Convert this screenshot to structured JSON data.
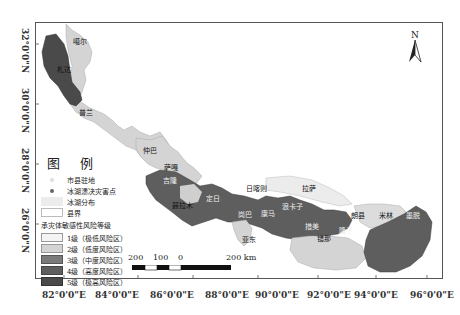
{
  "map": {
    "legend": {
      "title": "图 例",
      "items": [
        {
          "symbol": "city-dot",
          "label": "市县驻地"
        },
        {
          "symbol": "disaster-point",
          "label": "冰湖溃决灾害点"
        },
        {
          "symbol": "glacial-lake",
          "label": "冰湖分布"
        },
        {
          "symbol": "county-boundary",
          "label": "县界"
        }
      ],
      "risk_title": "承灾体敏感性风险等级",
      "risk_levels": [
        {
          "label": "1级（极低风险区）",
          "color": "#f4f4f4"
        },
        {
          "label": "2级（低度风险区）",
          "color": "#d4d4d4"
        },
        {
          "label": "3级（中度风险区）",
          "color": "#7a7a7a"
        },
        {
          "label": "4级（高度风险区）",
          "color": "#5e5e5e"
        },
        {
          "label": "5级（极高风险区）",
          "color": "#4a4a4a"
        }
      ]
    },
    "north_arrow": {
      "label": "N"
    },
    "scale_bar": {
      "labels": [
        "200",
        "100",
        "0",
        "200 km"
      ]
    },
    "longitude_labels": [
      "82°0'0\"E",
      "84°0'0\"E",
      "86°0'0\"E",
      "88°0'0\"E",
      "90°0'0\"E",
      "92°0'0\"E",
      "94°0'0\"E",
      "96°0'0\"E"
    ],
    "latitude_labels": [
      "32°0'0\"N",
      "30°0'0\"N",
      "28°0'0\"N",
      "26°0'0\"N"
    ],
    "places": [
      {
        "name": "噶尔",
        "x": 73,
        "y": 40
      },
      {
        "name": "札达",
        "x": 57,
        "y": 68
      },
      {
        "name": "普兰",
        "x": 80,
        "y": 110
      },
      {
        "name": "仲巴",
        "x": 143,
        "y": 148
      },
      {
        "name": "萨嘎",
        "x": 165,
        "y": 165
      },
      {
        "name": "吉隆",
        "x": 163,
        "y": 177
      },
      {
        "name": "聂拉木",
        "x": 173,
        "y": 203
      },
      {
        "name": "定日",
        "x": 207,
        "y": 194
      },
      {
        "name": "岗巴",
        "x": 239,
        "y": 214
      },
      {
        "name": "亚东",
        "x": 243,
        "y": 237
      },
      {
        "name": "日喀则",
        "x": 247,
        "y": 186
      },
      {
        "name": "拉萨",
        "x": 302,
        "y": 186
      },
      {
        "name": "康马",
        "x": 261,
        "y": 212
      },
      {
        "name": "浪卡子",
        "x": 283,
        "y": 203
      },
      {
        "name": "措美",
        "x": 306,
        "y": 224
      },
      {
        "name": "错那",
        "x": 318,
        "y": 235
      },
      {
        "name": "隆子",
        "x": 341,
        "y": 228
      },
      {
        "name": "朗县",
        "x": 352,
        "y": 213
      },
      {
        "name": "米林",
        "x": 380,
        "y": 213
      },
      {
        "name": "墨脱",
        "x": 407,
        "y": 213
      }
    ],
    "colors": {
      "level1": "#f4f4f4",
      "level2": "#d4d4d4",
      "level3": "#7a7a7a",
      "level4": "#5e5e5e",
      "level5": "#4a4a4a",
      "frame": "#555555"
    }
  }
}
